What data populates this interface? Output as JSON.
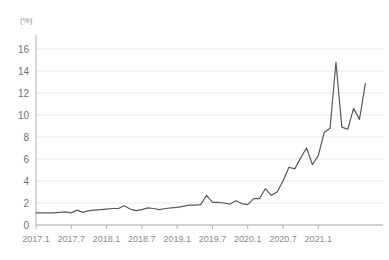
{
  "chart_data": {
    "type": "line",
    "title": "",
    "unit_label": "(%)",
    "xlabel": "",
    "ylabel": "",
    "ylim": [
      0,
      17
    ],
    "yticks": [
      0,
      2,
      4,
      6,
      8,
      10,
      12,
      14,
      16
    ],
    "grid": true,
    "legend": "none",
    "line_color": "#595959",
    "grid_color": "#e9e9e9",
    "axis_color": "#b0b0b0",
    "xtick_labels": [
      "2017.1",
      "2017.7",
      "2018.1",
      "2018.7",
      "2019.1",
      "2019.7",
      "2020.1",
      "2020.7",
      "2021.1"
    ],
    "xtick_indices": [
      0,
      6,
      12,
      18,
      24,
      30,
      36,
      42,
      48
    ],
    "x": [
      "2017.1",
      "2017.2",
      "2017.3",
      "2017.4",
      "2017.5",
      "2017.6",
      "2017.7",
      "2017.8",
      "2017.9",
      "2017.10",
      "2017.11",
      "2017.12",
      "2018.1",
      "2018.2",
      "2018.3",
      "2018.4",
      "2018.5",
      "2018.6",
      "2018.7",
      "2018.8",
      "2018.9",
      "2018.10",
      "2018.11",
      "2018.12",
      "2019.1",
      "2019.2",
      "2019.3",
      "2019.4",
      "2019.5",
      "2019.6",
      "2019.7",
      "2019.8",
      "2019.9",
      "2019.10",
      "2019.11",
      "2019.12",
      "2020.1",
      "2020.2",
      "2020.3",
      "2020.4",
      "2020.5",
      "2020.6",
      "2020.7",
      "2020.8",
      "2020.9",
      "2020.10",
      "2020.11",
      "2020.12",
      "2021.1",
      "2021.2",
      "2021.3",
      "2021.4",
      "2021.5",
      "2021.6"
    ],
    "values": [
      1.1,
      1.1,
      1.1,
      1.1,
      1.15,
      1.2,
      1.1,
      1.35,
      1.15,
      1.3,
      1.35,
      1.4,
      1.45,
      1.5,
      1.5,
      1.75,
      1.45,
      1.3,
      1.4,
      1.55,
      1.5,
      1.4,
      1.5,
      1.55,
      1.6,
      1.7,
      1.8,
      1.8,
      1.85,
      2.7,
      2.05,
      2.05,
      2.0,
      1.9,
      2.2,
      1.95,
      1.85,
      2.4,
      2.4,
      3.3,
      2.7,
      3.0,
      4.0,
      5.25,
      5.1,
      6.1,
      7.0,
      5.5,
      6.3,
      8.4,
      8.8,
      14.8,
      8.9,
      8.7
    ]
  },
  "end_values": [
    10.6,
    9.6,
    12.85
  ]
}
